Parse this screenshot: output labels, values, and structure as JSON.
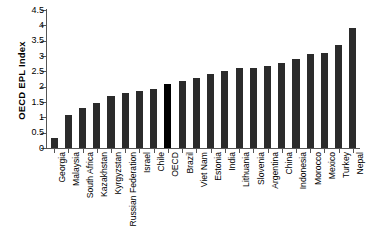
{
  "chart_data": {
    "type": "bar",
    "title": "",
    "xlabel": "",
    "ylabel": "OECD EPL Index",
    "ylim": [
      0,
      4.5
    ],
    "ytick_labels": [
      "4.5",
      "4",
      "3.5",
      "3",
      "2.5",
      "2",
      "1.5",
      "1",
      "0.5",
      "0"
    ],
    "ytick_values": [
      4.5,
      4,
      3.5,
      3,
      2.5,
      2,
      1.5,
      1,
      0.5,
      0
    ],
    "grid": false,
    "legend": "none",
    "highlight_category": "OECD",
    "colors": {
      "bar": "#2b2b2b",
      "highlight_bar": "#000000",
      "axis": "#555555",
      "background": "#ffffff"
    },
    "categories": [
      "Georgia",
      "Malaysia",
      "South Africa",
      "Kazakhstan",
      "Kyrgyzstan",
      "Russian Federation",
      "Israel",
      "Chile",
      "OECD",
      "Brazil",
      "Viet Nam",
      "Estonia",
      "India",
      "Lithuania",
      "Slovenia",
      "Argentina",
      "China",
      "Indonesia",
      "Morocco",
      "Mexico",
      "Turkey",
      "Nepal"
    ],
    "values": [
      0.32,
      1.07,
      1.32,
      1.48,
      1.68,
      1.78,
      1.87,
      1.92,
      2.1,
      2.2,
      2.28,
      2.4,
      2.5,
      2.6,
      2.62,
      2.68,
      2.78,
      2.9,
      3.05,
      3.1,
      3.35,
      3.9
    ]
  }
}
